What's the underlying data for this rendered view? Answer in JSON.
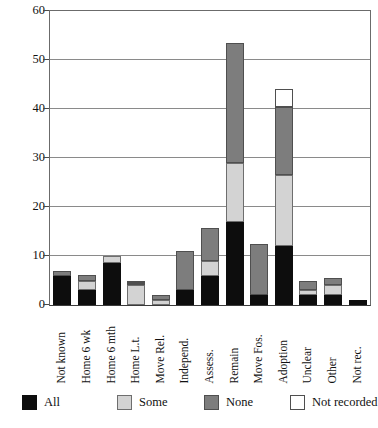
{
  "chart_data": {
    "type": "bar",
    "subtype": "stacked-vertical",
    "title": "",
    "xlabel": "",
    "ylabel": "",
    "ylim": [
      0,
      60
    ],
    "yticks": [
      0,
      10,
      20,
      30,
      40,
      50,
      60
    ],
    "grid": true,
    "legend_position": "bottom",
    "categories": [
      "Not known",
      "Home 6 wk",
      "Home 6 mth",
      "Home L.t.",
      "Move Rel.",
      "Independ.",
      "Assess.",
      "Remain",
      "Move Fos.",
      "Adoption",
      "Unclear",
      "Other",
      "Not rec."
    ],
    "series": [
      {
        "name": "All",
        "color": "#0d0d0d",
        "values": [
          6,
          3,
          8.5,
          0,
          0,
          3,
          6,
          17,
          2,
          12,
          2,
          2,
          1
        ]
      },
      {
        "name": "Some",
        "color": "#d3d3d3",
        "values": [
          0,
          2,
          1.5,
          4,
          1,
          0,
          3,
          12,
          0,
          14.5,
          1,
          2,
          0
        ]
      },
      {
        "name": "None",
        "color": "#7d7d7d",
        "values": [
          1,
          1.2,
          0,
          0.5,
          1,
          8,
          6.8,
          24.5,
          10.5,
          14,
          2,
          1.5,
          0
        ]
      },
      {
        "name": "Not recorded",
        "color": "#ffffff",
        "values": [
          0,
          0,
          0,
          0.5,
          0,
          0,
          0,
          0,
          0,
          3.5,
          0,
          0,
          0
        ]
      }
    ],
    "totals": [
      7,
      6.2,
      10,
      5,
      2,
      11,
      15.8,
      53.5,
      12.5,
      44,
      5,
      5.5,
      1
    ]
  },
  "legend": {
    "items": [
      {
        "label": "All",
        "swatch": "sw-all"
      },
      {
        "label": "Some",
        "swatch": "sw-some"
      },
      {
        "label": "None",
        "swatch": "sw-none"
      },
      {
        "label": "Not recorded",
        "swatch": "sw-notrec"
      }
    ]
  }
}
